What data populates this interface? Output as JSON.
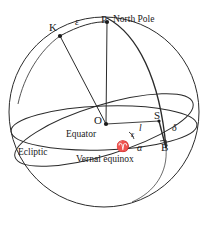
{
  "figure": {
    "type": "celestial-sphere-diagram",
    "stroke_color": "#2b2b2b",
    "background_color": "#ffffff",
    "points": {
      "north_pole": {
        "symbol": "P",
        "label": "North Pole",
        "x": 107,
        "y": 22
      },
      "ecliptic_pole": {
        "symbol": "K",
        "x": 60,
        "y": 36
      },
      "center": {
        "symbol": "O",
        "x": 106,
        "y": 124
      },
      "star": {
        "symbol": "S",
        "x": 159,
        "y": 121
      },
      "foot": {
        "symbol": "B",
        "x": 166,
        "y": 148
      },
      "vernal_equinox": {
        "symbol": "♈",
        "x": 122,
        "y": 146
      }
    },
    "angles": {
      "obliquity_arc": "ε",
      "obliquity_angle": "ε",
      "right_ascension": "α",
      "declination": "δ",
      "ecliptic_longitude": "l"
    },
    "curve_labels": {
      "equator": "Equator",
      "ecliptic": "Ecliptic",
      "vernal_equinox": "Vernal equinox"
    }
  },
  "labels": [
    {
      "id": "north-pole-symbol",
      "text": "P",
      "x": 101,
      "y": 14,
      "cls": "lbl-pt"
    },
    {
      "id": "north-pole-name",
      "text": "North Pole",
      "x": 113,
      "y": 15,
      "cls": "lbl-word"
    },
    {
      "id": "ecliptic-pole-symbol",
      "text": "K",
      "x": 49,
      "y": 22,
      "cls": "lbl-pt"
    },
    {
      "id": "obliquity-arc",
      "text": "ε",
      "x": 75,
      "y": 17,
      "cls": "lbl-gk"
    },
    {
      "id": "center-symbol",
      "text": "O",
      "x": 94,
      "y": 115,
      "cls": "lbl-pt"
    },
    {
      "id": "star-symbol",
      "text": "S",
      "x": 154,
      "y": 110,
      "cls": "lbl-pt"
    },
    {
      "id": "declination",
      "text": "δ",
      "x": 172,
      "y": 123,
      "cls": "lbl-gk"
    },
    {
      "id": "ecliptic-longitude",
      "text": "l",
      "x": 139,
      "y": 124,
      "cls": "lbl-it"
    },
    {
      "id": "equator-label",
      "text": "Equator",
      "x": 66,
      "y": 130,
      "cls": "lbl-word"
    },
    {
      "id": "obliquity-angle",
      "text": "ε",
      "x": 131,
      "y": 131,
      "cls": "lbl-gk-sm"
    },
    {
      "id": "right-ascension",
      "text": "α",
      "x": 137,
      "y": 143,
      "cls": "lbl-gk"
    },
    {
      "id": "foot-symbol",
      "text": "B",
      "x": 161,
      "y": 142,
      "cls": "lbl-pt"
    },
    {
      "id": "ecliptic-label",
      "text": "Ecliptic",
      "x": 18,
      "y": 148,
      "cls": "lbl-word"
    },
    {
      "id": "aries-symbol",
      "text": "♈",
      "x": 116,
      "y": 141,
      "cls": "lbl-aries"
    },
    {
      "id": "vernal-equinox-label",
      "text": "Vernal equinox",
      "x": 76,
      "y": 155,
      "cls": "lbl-word"
    }
  ]
}
